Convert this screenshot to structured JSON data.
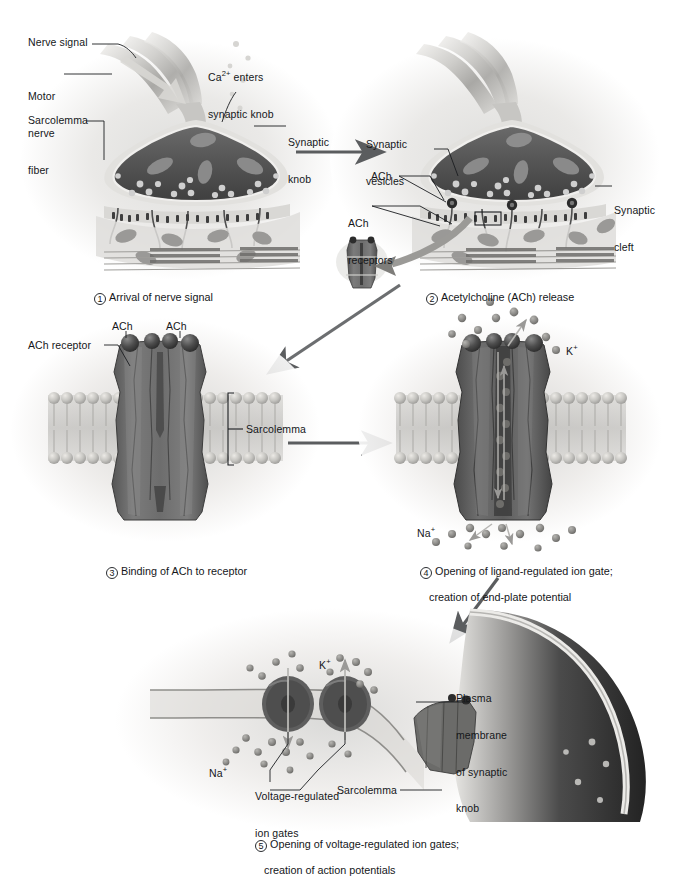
{
  "figure": {
    "type": "biological-process-diagram",
    "style": "grayscale airbrush medical illustration",
    "palette": {
      "background": "#ffffff",
      "page_tint": "#f2f1ef",
      "knob_interior": "#5a5a5a",
      "knob_dark": "#3c3c3c",
      "protein_gray": "#6e6e6e",
      "protein_dark": "#4a4a4a",
      "membrane_gray": "#b9b9b7",
      "arrow_gray": "#5b5d5f",
      "label_text": "#15171a",
      "muscle_fiber": "#8e8e8c"
    }
  },
  "panels": [
    {
      "id": "panel-1",
      "step": "1",
      "caption": "Arrival of nerve signal",
      "labels": [
        {
          "name": "nerve-signal",
          "text": "Nerve signal"
        },
        {
          "name": "motor-nerve-fiber",
          "text": "Motor\nnerve\nfiber"
        },
        {
          "name": "sarcolemma",
          "text": "Sarcolemma"
        },
        {
          "name": "calcium-enters",
          "text": "Ca2+ enters\nsynaptic knob",
          "superscript": "2+"
        },
        {
          "name": "synaptic-knob",
          "text": "Synaptic\nknob"
        }
      ]
    },
    {
      "id": "panel-2",
      "step": "2",
      "caption": "Acetylcholine (ACh) release",
      "labels": [
        {
          "name": "synaptic-vesicles",
          "text": "Synaptic\nvesicles"
        },
        {
          "name": "ach",
          "text": "ACh"
        },
        {
          "name": "ach-receptors",
          "text": "ACh\nreceptors"
        },
        {
          "name": "synaptic-cleft",
          "text": "Synaptic\ncleft"
        }
      ]
    },
    {
      "id": "panel-3",
      "step": "3",
      "caption": "Binding of ACh to receptor",
      "labels": [
        {
          "name": "ach-left",
          "text": "ACh"
        },
        {
          "name": "ach-right",
          "text": "ACh"
        },
        {
          "name": "ach-receptor",
          "text": "ACh receptor"
        },
        {
          "name": "sarcolemma",
          "text": "Sarcolemma"
        }
      ]
    },
    {
      "id": "panel-4",
      "step": "4",
      "caption": "Opening of ligand-regulated ion gate;\n    creation of end-plate potential",
      "caption_line1": "Opening of ligand-regulated ion gate;",
      "caption_line2": "creation of end-plate potential",
      "labels": [
        {
          "name": "potassium-ion",
          "text": "K+",
          "superscript": "+"
        },
        {
          "name": "sodium-ion",
          "text": "Na+",
          "superscript": "+"
        }
      ]
    },
    {
      "id": "panel-5",
      "step": "5",
      "caption_line1": "Opening of voltage-regulated ion gates;",
      "caption_line2": "creation of action potentials",
      "labels": [
        {
          "name": "potassium-ion",
          "text": "K+",
          "superscript": "+"
        },
        {
          "name": "sodium-ion",
          "text": "Na+",
          "superscript": "+"
        },
        {
          "name": "voltage-regulated-ion-gates",
          "text": "Voltage-regulated\nion gates"
        },
        {
          "name": "plasma-membrane-of-synaptic-knob",
          "text": "Plasma\nmembrane\nof synaptic\nknob"
        },
        {
          "name": "sarcolemma",
          "text": "Sarcolemma"
        }
      ]
    }
  ],
  "text": {
    "nerve_signal": "Nerve signal",
    "motor_nerve_fiber_l1": "Motor",
    "motor_nerve_fiber_l2": "nerve",
    "motor_nerve_fiber_l3": "fiber",
    "sarcolemma": "Sarcolemma",
    "calcium_l1_pre": "Ca",
    "calcium_l1_sup": "2+",
    "calcium_l1_post": " enters",
    "calcium_l2": "synaptic knob",
    "synaptic_knob_l1": "Synaptic",
    "synaptic_knob_l2": "knob",
    "synaptic_vesicles_l1": "Synaptic",
    "synaptic_vesicles_l2": "vesicles",
    "ach": "ACh",
    "ach_receptors_l1": "ACh",
    "ach_receptors_l2": "receptors",
    "synaptic_cleft_l1": "Synaptic",
    "synaptic_cleft_l2": "cleft",
    "ach_receptor": "ACh receptor",
    "k_ion": "K",
    "k_sup": "+",
    "na_ion": "Na",
    "na_sup": "+",
    "voltage_gates_l1": "Voltage-regulated",
    "voltage_gates_l2": "ion gates",
    "plasma_mem_l1": "Plasma",
    "plasma_mem_l2": "membrane",
    "plasma_mem_l3": "of synaptic",
    "plasma_mem_l4": "knob",
    "step1_num": "1",
    "step1_text": "Arrival of nerve signal",
    "step2_num": "2",
    "step2_text": "Acetylcholine (ACh) release",
    "step3_num": "3",
    "step3_text": "Binding of ACh to receptor",
    "step4_num": "4",
    "step4_l1": "Opening of ligand-regulated ion gate;",
    "step4_l2": "creation of end-plate potential",
    "step5_num": "5",
    "step5_l1": "Opening of voltage-regulated ion gates;",
    "step5_l2": "creation of action potentials"
  }
}
